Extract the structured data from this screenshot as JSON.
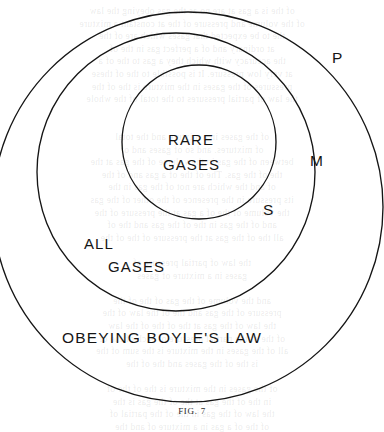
{
  "figure": {
    "caption": "FIG. 7",
    "background_color": "#ffffff",
    "ink_color": "#151515"
  },
  "diagram": {
    "type": "nested-circles-venn",
    "circles": [
      {
        "key": "P",
        "name": "outer-circle",
        "region_label": "OBEYING BOYLE'S LAW",
        "cx": 188,
        "cy": 207,
        "r": 195
      },
      {
        "key": "M",
        "name": "middle-circle",
        "region_label": "ALL GASES",
        "cx": 176,
        "cy": 172,
        "r": 139
      },
      {
        "key": "S",
        "name": "inner-circle",
        "region_label": "RARE GASES",
        "cx": 199,
        "cy": 142,
        "r": 77
      }
    ],
    "labels": {
      "outer_key": "P",
      "middle_key": "M",
      "inner_key": "S",
      "inner_region_line1": "RARE",
      "inner_region_line2": "GASES",
      "middle_region_line1": "ALL",
      "middle_region_line2": "GASES",
      "outer_region": "OBEYING BOYLE'S  LAW"
    }
  },
  "ghost_text": {
    "lines": [
      "of the is a gas at are no as the gas obeying the law",
      "of the volume and pressure of the at constant a mixture",
      "the to be expected that gases which are of the",
      "at ordinary and of a perfect gas in the of",
      "the accuracy with which they a gas to the of a",
      "at very low pressure. It is possible to the of these",
      "pressures of the gases in the mixture is the of the",
      "the law of partial pressures to the total of the whole",
      "",
      "",
      "of the gases in a mixture and the total",
      "of mixtures. and so of gases and of",
      "between of the gas in the volume of the gas at the",
      "the of the gas. The of the of a gas and of the",
      "of and the which are not of the gas in the",
      "its pressure in the presence of the other of the gas",
      "the volume of the of a gas at the pressure of the",
      "and of the gas in the of the gas and the of",
      "all the of the gas at the pressure of the of the",
      "",
      "the law of partial pressure of",
      "gases in a mixture of gases",
      "",
      "and the volume of the gas of the of the",
      "pressure of the gas and the of the law of the",
      "the law of the gas at the of the of the law",
      "of the of the partial pressure of each of the of",
      "all of the gases in the mixture is the sum of the",
      "is the of the gases and the of the",
      "",
      "of the gases in the mixture is the of the of",
      "in the of the gas at the of the gas is the",
      "the law of the gas in the of the partial of",
      "of the of a gas in a mixture of and the"
    ]
  }
}
